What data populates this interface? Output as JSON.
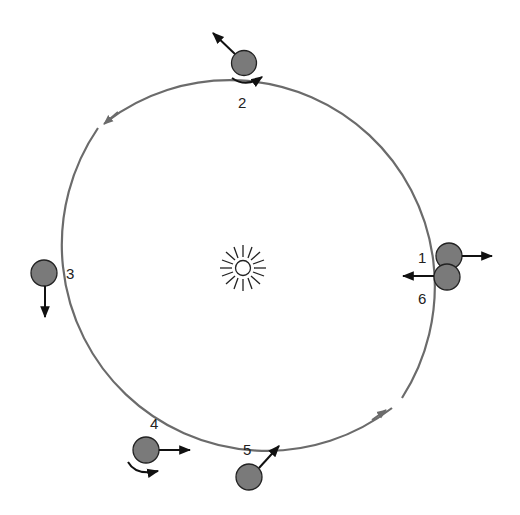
{
  "diagram": {
    "type": "orbit-sequence",
    "orbit": {
      "cx": 242,
      "cy": 268,
      "rx": 205,
      "ry": 206,
      "color": "#6b6b6b"
    },
    "sun": {
      "cx": 243,
      "cy": 268,
      "label": "sun-icon"
    },
    "planet_fill": "#7a7a7a",
    "planets": [
      {
        "id": "1",
        "label": "1",
        "x": 449,
        "y": 256,
        "label_x": 418,
        "label_y": 264,
        "arrow": "right"
      },
      {
        "id": "2",
        "label": "2",
        "x": 244,
        "y": 63,
        "label_x": 238,
        "label_y": 108,
        "arrow": "up-left",
        "spin": true
      },
      {
        "id": "3",
        "label": "3",
        "x": 44,
        "y": 273,
        "label_x": 66,
        "label_y": 279,
        "arrow": "down"
      },
      {
        "id": "4",
        "label": "4",
        "x": 146,
        "y": 450,
        "label_x": 152,
        "label_y": 430,
        "arrow": "right",
        "spin": true
      },
      {
        "id": "5",
        "label": "5",
        "x": 249,
        "y": 478,
        "label_x": 243,
        "label_y": 455,
        "arrow": "up-right"
      },
      {
        "id": "6",
        "label": "6",
        "x": 447,
        "y": 276,
        "label_x": 418,
        "label_y": 304,
        "arrow": "left"
      }
    ]
  }
}
